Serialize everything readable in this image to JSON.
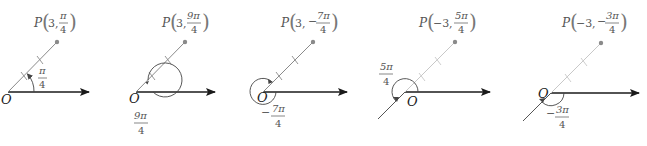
{
  "colors": {
    "axis": "#1a1a1a",
    "ray_dark": "#8a8a8a",
    "ray_light": "#c8c8c8",
    "point": "#8a8a8a",
    "label": "#555555",
    "angle": "#444444"
  },
  "diagrams": [
    {
      "origin_label": "O",
      "point_label": {
        "prefix": "P",
        "r": "3",
        "theta_num": "π",
        "theta_den": "4",
        "theta_sign": ""
      },
      "angle_label": {
        "sign": "",
        "num": "π",
        "den": "4"
      },
      "description": "P(3, π/4)"
    },
    {
      "origin_label": "O",
      "point_label": {
        "prefix": "P",
        "r": "3",
        "theta_num": "9π",
        "theta_den": "4",
        "theta_sign": ""
      },
      "angle_label": {
        "sign": "",
        "num": "9π",
        "den": "4"
      },
      "description": "P(3, 9π/4)"
    },
    {
      "origin_label": "O",
      "point_label": {
        "prefix": "P",
        "r": "3",
        "theta_num": "7π",
        "theta_den": "4",
        "theta_sign": "−"
      },
      "angle_label": {
        "sign": "−",
        "num": "7π",
        "den": "4"
      },
      "description": "P(3, −7π/4)"
    },
    {
      "origin_label": "O",
      "point_label": {
        "prefix": "P",
        "r": "−3",
        "theta_num": "5π",
        "theta_den": "4",
        "theta_sign": ""
      },
      "angle_label": {
        "sign": "",
        "num": "5π",
        "den": "4"
      },
      "description": "P(−3, 5π/4)"
    },
    {
      "origin_label": "O",
      "point_label": {
        "prefix": "P",
        "r": "−3",
        "theta_num": "3π",
        "theta_den": "4",
        "theta_sign": "−"
      },
      "angle_label": {
        "sign": "−",
        "num": "3π",
        "den": "4"
      },
      "description": "P(−3, −3π/4)"
    }
  ]
}
